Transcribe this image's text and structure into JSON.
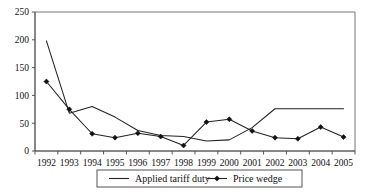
{
  "chart_data": {
    "type": "line",
    "title": "",
    "xlabel": "",
    "ylabel": "",
    "grid": false,
    "legend_position": "bottom-center",
    "categories": [
      "1992",
      "1993",
      "1994",
      "1995",
      "1996",
      "1997",
      "1998",
      "1999",
      "2000",
      "2001",
      "2002",
      "2003",
      "2004",
      "2005"
    ],
    "x": [
      1992,
      1993,
      1994,
      1995,
      1996,
      1997,
      1998,
      1999,
      2000,
      2001,
      2002,
      2003,
      2004,
      2005
    ],
    "ylim": [
      0,
      250
    ],
    "yticks": [
      0,
      50,
      100,
      150,
      200,
      250
    ],
    "ytick_labels": [
      "0",
      "50",
      "100",
      "150",
      "200",
      "250"
    ],
    "xtick_labels": [
      "1992",
      "1993",
      "1994",
      "1995",
      "1996",
      "1997",
      "1998",
      "1999",
      "2000",
      "2001",
      "2002",
      "2003",
      "2004",
      "2005"
    ],
    "series": [
      {
        "name": "Applied tariff duty",
        "marker": "none",
        "color": "#222222",
        "values": [
          198,
          68,
          80,
          61,
          37,
          28,
          26,
          18,
          20,
          42,
          76,
          76,
          76,
          76
        ]
      },
      {
        "name": "Price wedge",
        "marker": "diamond",
        "color": "#111111",
        "values": [
          125,
          75,
          31,
          24,
          32,
          26,
          10,
          52,
          57,
          36,
          24,
          22,
          43,
          25
        ]
      }
    ]
  },
  "legend": {
    "items": [
      {
        "label": "Applied tariff duty",
        "marker": "line"
      },
      {
        "label": "Price wedge",
        "marker": "line-diamond"
      }
    ]
  },
  "colors": {
    "axis": "#555555",
    "plot_border": "#777777",
    "series_1": "#222222",
    "series_2": "#111111",
    "background": "#ffffff"
  }
}
